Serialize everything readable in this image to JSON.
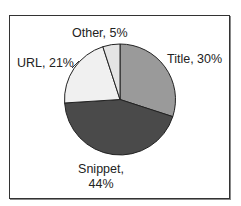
{
  "chart_data": {
    "type": "pie",
    "title": "",
    "start_angle_deg": 0,
    "direction": "clockwise",
    "categories": [
      "Title",
      "Snippet",
      "URL",
      "Other"
    ],
    "values": [
      30,
      44,
      21,
      5
    ],
    "unit": "%",
    "colors": [
      "#9a9a9a",
      "#4a4a4a",
      "#f0f0f0",
      "#e4e4e4"
    ],
    "labels": [
      "Title, 30%",
      "Snippet, 44%",
      "URL, 21%",
      "Other, 5%"
    ],
    "legend": "none",
    "data_labels": "outside"
  },
  "labels": {
    "title": "Title, 30%",
    "snippet_line1": "Snippet,",
    "snippet_line2": "44%",
    "url": "URL, 21%",
    "other": "Other, 5%"
  }
}
